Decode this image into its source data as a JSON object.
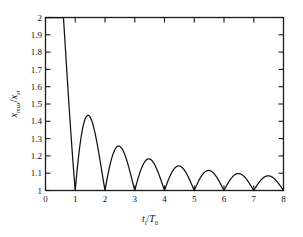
{
  "figure": {
    "background_color": "#ffffff",
    "axis_color": "#1a1a1a",
    "curve_color": "#111111"
  },
  "axes": {
    "x_label_parts": {
      "var": "t",
      "var_sub": "i",
      "slash": "/",
      "den": "T",
      "den_sub": "0"
    },
    "y_label_parts": {
      "var": "x",
      "var_sub": "max",
      "slash": "/",
      "den": "x",
      "den_sub": "st"
    },
    "x_ticklabels": [
      "0",
      "1",
      "2",
      "3",
      "4",
      "5",
      "6",
      "7",
      "8"
    ],
    "y_ticklabels": [
      "1",
      "1.1",
      "1.2",
      "1.3",
      "1.4",
      "1.5",
      "1.6",
      "1.7",
      "1.8",
      "1.9",
      "2"
    ]
  },
  "chart_data": {
    "type": "line",
    "title": "",
    "xlabel": "t_i/T_0",
    "ylabel": "x_max/x_st",
    "xlim": [
      0,
      8
    ],
    "ylim": [
      1,
      2
    ],
    "xticks": [
      0,
      1,
      2,
      3,
      4,
      5,
      6,
      7,
      8
    ],
    "yticks": [
      1,
      1.1,
      1.2,
      1.3,
      1.4,
      1.5,
      1.6,
      1.7,
      1.8,
      1.9,
      2.0
    ],
    "grid": false,
    "legend": null,
    "series": [
      {
        "name": "x_max/x_st",
        "description": "Maximum dynamic response factor versus normalized rise time; decaying oscillation touching 1 at integer t_i/T_0",
        "x": [
          0,
          0.05,
          0.1,
          0.15,
          0.2,
          0.25,
          0.3,
          0.35,
          0.4,
          0.45,
          0.5,
          0.55,
          0.6,
          0.65,
          0.7,
          0.75,
          0.8,
          0.85,
          0.9,
          0.95,
          1.0,
          1.05,
          1.1,
          1.15,
          1.2,
          1.25,
          1.3,
          1.35,
          1.4,
          1.45,
          1.5,
          1.55,
          1.6,
          1.65,
          1.7,
          1.75,
          1.8,
          1.85,
          1.9,
          1.95,
          2.0,
          2.1,
          2.2,
          2.3,
          2.4,
          2.5,
          2.6,
          2.7,
          2.8,
          2.9,
          3.0,
          3.1,
          3.2,
          3.3,
          3.4,
          3.5,
          3.6,
          3.7,
          3.8,
          3.9,
          4.0,
          4.1,
          4.2,
          4.3,
          4.4,
          4.5,
          4.6,
          4.7,
          4.8,
          4.9,
          5.0,
          5.1,
          5.2,
          5.3,
          5.4,
          5.5,
          5.6,
          5.7,
          5.8,
          5.9,
          6.0,
          6.1,
          6.2,
          6.3,
          6.4,
          6.5,
          6.6,
          6.7,
          6.8,
          6.9,
          7.0,
          7.1,
          7.2,
          7.3,
          7.4,
          7.5,
          7.6,
          7.7,
          7.8,
          7.9,
          8.0
        ],
        "y": [
          2.0,
          1.999,
          1.994,
          1.972,
          1.936,
          1.9,
          1.861,
          1.819,
          1.773,
          1.724,
          1.637,
          1.58,
          1.52,
          1.46,
          1.398,
          1.333,
          1.267,
          1.2,
          1.132,
          1.065,
          1.0,
          1.031,
          1.06,
          1.088,
          1.114,
          1.138,
          1.16,
          1.179,
          1.196,
          1.21,
          1.212,
          1.205,
          1.19,
          1.172,
          1.15,
          1.128,
          1.102,
          1.077,
          1.05,
          1.025,
          1.0,
          1.026,
          1.05,
          1.073,
          1.094,
          1.112,
          1.124,
          1.122,
          1.11,
          1.085,
          1.0,
          1.02,
          1.04,
          1.058,
          1.073,
          1.085,
          1.09,
          1.086,
          1.073,
          1.045,
          1.0,
          1.018,
          1.035,
          1.05,
          1.062,
          1.071,
          1.073,
          1.068,
          1.056,
          1.033,
          1.0,
          1.016,
          1.031,
          1.044,
          1.054,
          1.061,
          1.062,
          1.057,
          1.046,
          1.027,
          1.0,
          1.014,
          1.027,
          1.038,
          1.047,
          1.052,
          1.053,
          1.049,
          1.039,
          1.023,
          1.0,
          1.012,
          1.024,
          1.034,
          1.041,
          1.046,
          1.046,
          1.042,
          1.034,
          1.02,
          1.0
        ],
        "key_points": {
          "start_value": 2.0,
          "zeros_at": [
            1,
            2,
            3,
            4,
            5,
            6,
            7,
            8
          ],
          "peak_positions": [
            1.45,
            2.45,
            3.47,
            4.48,
            5.49,
            6.5,
            7.5
          ],
          "peak_values": [
            1.212,
            1.124,
            1.09,
            1.073,
            1.062,
            1.053,
            1.046
          ]
        }
      }
    ]
  }
}
